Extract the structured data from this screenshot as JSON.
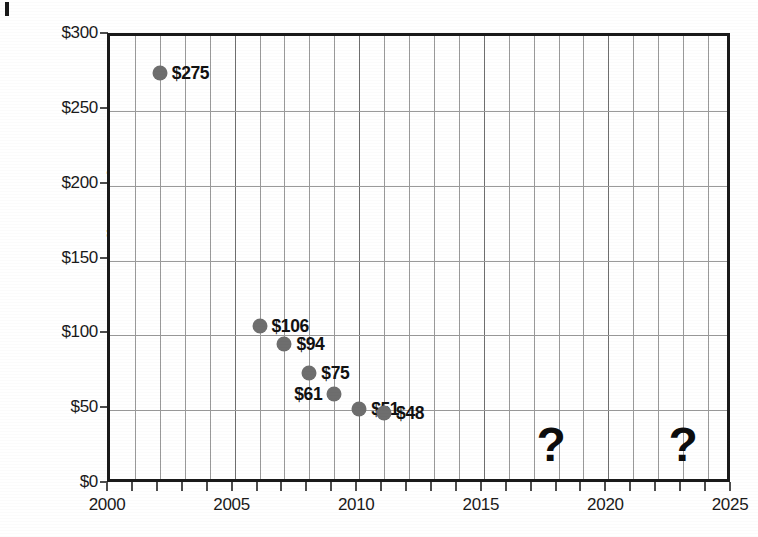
{
  "chart_data": {
    "type": "scatter",
    "title": "",
    "xlabel": "",
    "ylabel": "Current Year Dollars per kW",
    "xlim": [
      2000,
      2025
    ],
    "ylim": [
      0,
      300
    ],
    "x_tick_labels": [
      "2000",
      "2005",
      "2010",
      "2015",
      "2020",
      "2025"
    ],
    "x_tick_values": [
      2000,
      2005,
      2010,
      2015,
      2020,
      2025
    ],
    "x_minor_step": 1,
    "y_tick_labels": [
      "$0",
      "$50",
      "$100",
      "$150",
      "$200",
      "$250",
      "$300"
    ],
    "y_tick_values": [
      0,
      50,
      100,
      150,
      200,
      250,
      300
    ],
    "grid": "both",
    "legend": "none",
    "marker_color": "#6e6e6e",
    "points": [
      {
        "x": 2002,
        "y": 275,
        "label": "$275",
        "label_side": "right"
      },
      {
        "x": 2006,
        "y": 106,
        "label": "$106",
        "label_side": "right"
      },
      {
        "x": 2007,
        "y": 94,
        "label": "$94",
        "label_side": "right"
      },
      {
        "x": 2008,
        "y": 75,
        "label": "$75",
        "label_side": "right"
      },
      {
        "x": 2009,
        "y": 61,
        "label": "$61",
        "label_side": "left"
      },
      {
        "x": 2010,
        "y": 51,
        "label": "$51",
        "label_side": "right"
      },
      {
        "x": 2011,
        "y": 48,
        "label": "$48",
        "label_side": "right"
      }
    ],
    "annotations": [
      {
        "text": "?",
        "x": 2017.7,
        "y": 27
      },
      {
        "text": "?",
        "x": 2023.0,
        "y": 27
      }
    ]
  }
}
